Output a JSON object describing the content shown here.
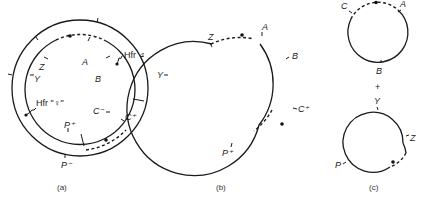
{
  "figure": {
    "panels": [
      {
        "id": "a",
        "caption": "(a)",
        "labels": {
          "Z": "Z",
          "Y": "Y",
          "A": "A",
          "B": "B",
          "C_minus": "C⁻",
          "C_plus": "C⁺",
          "P_plus": "P⁺",
          "P_minus": "P⁻",
          "hfr_male": "Hfr ♂",
          "hfr_female": "Hfr \"♀\""
        }
      },
      {
        "id": "b",
        "caption": "(b)",
        "labels": {
          "Z": "Z",
          "A": "A",
          "B": "B",
          "Y": "Y",
          "C_plus": "C⁺",
          "P_plus": "P⁺"
        }
      },
      {
        "id": "c",
        "caption": "(c)",
        "top_circle": {
          "C": "C",
          "A": "A",
          "B": "B"
        },
        "plus": "+",
        "bottom_circle": {
          "Y": "Y",
          "Z": "Z",
          "P": "P"
        }
      }
    ]
  }
}
